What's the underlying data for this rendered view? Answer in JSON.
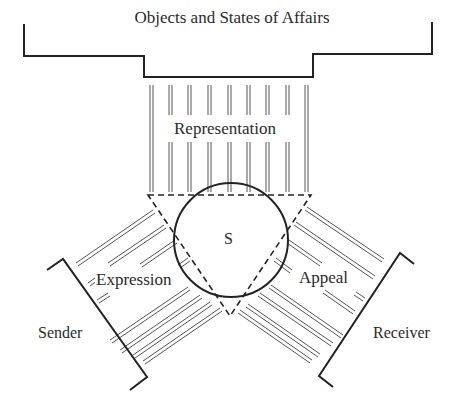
{
  "diagram": {
    "labels": {
      "objects": "Objects and States of Affairs",
      "representation": "Representation",
      "sign": "S",
      "expression": "Expression",
      "appeal": "Appeal",
      "sender": "Sender",
      "receiver": "Receiver"
    },
    "colors": {
      "line": "#222222",
      "hatch": "#555555",
      "background": "#ffffff"
    },
    "nodes": [
      {
        "id": "objects",
        "label": "Objects and States of Affairs",
        "shape": "bracket-top"
      },
      {
        "id": "sender",
        "label": "Sender",
        "shape": "bracket-left"
      },
      {
        "id": "receiver",
        "label": "Receiver",
        "shape": "bracket-right"
      },
      {
        "id": "sign",
        "label": "S",
        "shape": "circle+dashed-triangle"
      }
    ],
    "edges": [
      {
        "from": "sign",
        "to": "objects",
        "label": "Representation",
        "style": "parallel-lines"
      },
      {
        "from": "sign",
        "to": "sender",
        "label": "Expression",
        "style": "parallel-lines"
      },
      {
        "from": "sign",
        "to": "receiver",
        "label": "Appeal",
        "style": "parallel-lines"
      }
    ]
  }
}
